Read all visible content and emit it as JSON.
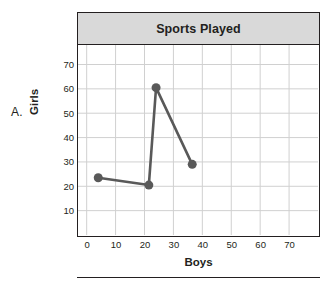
{
  "item_label": "A.",
  "top_sliver_text": "",
  "chart": {
    "title": "Sports Played",
    "xlabel": "Boys",
    "ylabel": "Girls"
  },
  "chart_data": {
    "type": "line",
    "title": "Sports Played",
    "xlabel": "Boys",
    "ylabel": "Girls",
    "x": [
      4,
      21.5,
      24,
      36.5
    ],
    "y": [
      23.5,
      20.5,
      60.5,
      29
    ],
    "points": [
      {
        "x": 4,
        "y": 23.5
      },
      {
        "x": 21.5,
        "y": 20.5
      },
      {
        "x": 24,
        "y": 60.5
      },
      {
        "x": 36.5,
        "y": 29
      }
    ],
    "xlim": [
      -3,
      80
    ],
    "ylim": [
      0,
      78
    ],
    "xticks": [
      0,
      10,
      20,
      30,
      40,
      50,
      60,
      70
    ],
    "yticks": [
      10,
      20,
      30,
      40,
      50,
      60,
      70
    ],
    "grid": true,
    "legend": "none",
    "series_color": "#595959",
    "marker": "circle",
    "marker_size": 9
  },
  "colors": {
    "title_bar_bg": "#d9d9d9",
    "frame": "#231f20",
    "grid": "#d0d0d0",
    "series": "#595959"
  }
}
